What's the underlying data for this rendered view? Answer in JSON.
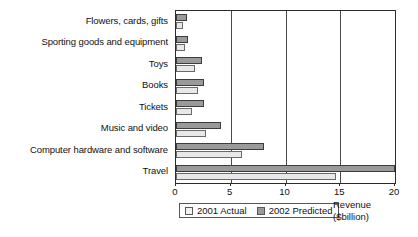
{
  "chart_data": {
    "type": "bar",
    "orientation": "horizontal",
    "title": "",
    "subtitle": "",
    "xlabel": "Revenue ($billion)",
    "ylabel": "",
    "xlim": [
      0,
      20
    ],
    "xticks": [
      0,
      5,
      10,
      15,
      20
    ],
    "xtick_labels": [
      "0",
      "5",
      "10",
      "15",
      "20"
    ],
    "grid": "vertical",
    "legend_position": "bottom-left",
    "categories": [
      "Flowers, cards, gifts",
      "Sporting goods and equipment",
      "Toys",
      "Books",
      "Tickets",
      "Music and video",
      "Computer hardware and software",
      "Travel"
    ],
    "series": [
      {
        "name": "2001 Actual",
        "color": "#e8e8e8",
        "values": [
          0.6,
          0.8,
          1.7,
          2.0,
          1.5,
          2.7,
          6.0,
          14.6
        ]
      },
      {
        "name": "2002 Predicted",
        "color": "#9a9a9a",
        "values": [
          1.0,
          1.1,
          2.4,
          2.6,
          2.6,
          4.1,
          8.0,
          20.0
        ]
      }
    ]
  },
  "legend": {
    "entries": [
      {
        "label": "2001 Actual",
        "swatch": "actual"
      },
      {
        "label": "2002 Predicted",
        "swatch": "predicted"
      }
    ]
  },
  "axis_title": {
    "line1": "Revenue",
    "line2": "($billion)"
  },
  "colors": {
    "actual": "#e8e8e8",
    "predicted": "#9a9a9a",
    "axis": "#2b2b2b",
    "grid": "#4a4a4a",
    "text": "#111111"
  }
}
